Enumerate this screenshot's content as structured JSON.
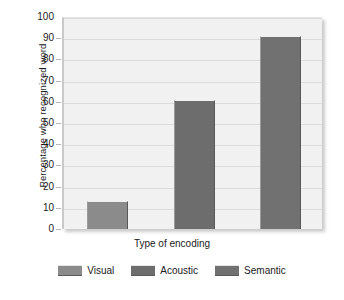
{
  "chart_data": {
    "type": "bar",
    "title": "",
    "subtitle": "",
    "xlabel": "Type of encoding",
    "ylabel": "Percentage who recognized word",
    "categories": [
      "Visual",
      "Acoustic",
      "Semantic"
    ],
    "values": [
      13,
      61,
      91
    ],
    "ylim": [
      0,
      100
    ],
    "ytick_step": 10,
    "yticks": [
      100,
      90,
      80,
      70,
      60,
      50,
      40,
      30,
      20,
      10,
      0
    ],
    "ytick_labels": [
      "100",
      "90",
      "80",
      "70",
      "60",
      "50",
      "40",
      "30",
      "20",
      "10",
      "0"
    ],
    "grid": true,
    "grid_axis": "y",
    "legend_position": "bottom",
    "legend": [
      {
        "label": "Visual",
        "color": "#8b8b8b",
        "value": 13
      },
      {
        "label": "Acoustic",
        "color": "#6d6d6d",
        "value": 61
      },
      {
        "label": "Semantic",
        "color": "#717171",
        "value": 91
      }
    ],
    "annotations": []
  },
  "colors": {
    "plot_background": "#f1f1f1",
    "gridline": "#dcdcdc",
    "axis": "#c9c9c9",
    "text": "#1b1b1b",
    "page_background": "#ffffff"
  }
}
